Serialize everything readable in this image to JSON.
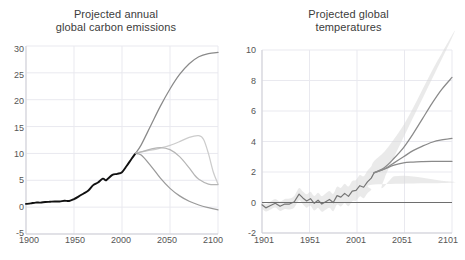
{
  "figure": {
    "width": 465,
    "height": 260,
    "background": "#ffffff",
    "text_color": "#3c3c3c",
    "grid_color": "#e9e9ef"
  },
  "panels": [
    {
      "id": "emissions",
      "title": "Projected annual\nglobal carbon emissions"
    },
    {
      "id": "temperatures",
      "title": "Projected global\ntemperatures"
    }
  ],
  "chart_data": [
    {
      "type": "line",
      "id": "emissions",
      "title": "Projected annual global carbon emissions",
      "xlabel": "",
      "ylabel": "",
      "xlim": [
        1900,
        2100
      ],
      "ylim": [
        -5,
        30
      ],
      "xticks": [
        1900,
        1950,
        2000,
        2050,
        2100
      ],
      "yticks": [
        -5,
        0,
        5,
        10,
        15,
        20,
        25,
        30
      ],
      "grid": true,
      "legend": "none",
      "series": [
        {
          "name": "historical",
          "color": "#111111",
          "width": 1.9,
          "x": [
            1900,
            1905,
            1910,
            1915,
            1920,
            1925,
            1930,
            1935,
            1940,
            1945,
            1950,
            1955,
            1960,
            1965,
            1970,
            1975,
            1980,
            1983,
            1985,
            1990,
            1995,
            2000,
            2005,
            2010,
            2014
          ],
          "values": [
            0.6,
            0.7,
            0.85,
            0.85,
            0.95,
            1.0,
            1.05,
            1.05,
            1.2,
            1.15,
            1.5,
            2.0,
            2.55,
            3.1,
            4.1,
            4.6,
            5.3,
            5.0,
            5.25,
            6.0,
            6.2,
            6.5,
            7.7,
            9.0,
            10.0
          ]
        },
        {
          "name": "rcp8.5-high",
          "color": "#8a8a8a",
          "width": 1.25,
          "x": [
            2014,
            2020,
            2030,
            2040,
            2050,
            2060,
            2070,
            2080,
            2090,
            2100
          ],
          "values": [
            10.0,
            11.6,
            15.2,
            18.8,
            22.0,
            24.7,
            26.7,
            28.0,
            28.6,
            28.8
          ]
        },
        {
          "name": "rcp6.0-mid-late-peak",
          "color": "#cccccc",
          "width": 1.25,
          "x": [
            2014,
            2020,
            2030,
            2040,
            2050,
            2060,
            2070,
            2080,
            2085,
            2090,
            2095,
            2100
          ],
          "values": [
            10.0,
            10.3,
            10.6,
            11.0,
            11.5,
            12.2,
            13.0,
            13.3,
            12.6,
            10.0,
            6.6,
            4.3
          ]
        },
        {
          "name": "rcp4.5-mid-early-peak",
          "color": "#b5b5b5",
          "width": 1.25,
          "x": [
            2014,
            2020,
            2030,
            2040,
            2050,
            2060,
            2070,
            2075,
            2080,
            2090,
            2100
          ],
          "values": [
            10.0,
            10.3,
            10.8,
            11.1,
            10.7,
            9.4,
            7.3,
            6.1,
            5.2,
            4.3,
            4.2
          ]
        },
        {
          "name": "rcp2.6-mitigation",
          "color": "#9a9a9a",
          "width": 1.25,
          "x": [
            2014,
            2020,
            2030,
            2040,
            2050,
            2060,
            2070,
            2080,
            2090,
            2100
          ],
          "values": [
            10.0,
            9.7,
            7.7,
            5.4,
            3.5,
            2.1,
            1.1,
            0.4,
            -0.1,
            -0.5
          ]
        }
      ]
    },
    {
      "type": "line",
      "id": "temperatures",
      "title": "Projected global temperatures",
      "xlabel": "",
      "ylabel": "",
      "xlim": [
        1901,
        2101
      ],
      "ylim": [
        -2,
        10
      ],
      "xticks": [
        1901,
        1951,
        2001,
        2051,
        2101
      ],
      "yticks": [
        -2,
        0,
        2,
        4,
        6,
        8,
        10
      ],
      "grid": true,
      "legend": "none",
      "uncertainty_band": {
        "color": "#d8d8d8",
        "description": "grey shaded spread around observed and projected temperature lines"
      },
      "series": [
        {
          "name": "observed",
          "color": "#767676",
          "width": 1.2,
          "x": [
            1901,
            1905,
            1910,
            1915,
            1920,
            1925,
            1930,
            1935,
            1940,
            1944,
            1948,
            1952,
            1956,
            1960,
            1964,
            1968,
            1972,
            1976,
            1980,
            1984,
            1988,
            1992,
            1996,
            2000,
            2004,
            2008,
            2012,
            2016,
            2019
          ],
          "values": [
            -0.15,
            -0.35,
            -0.2,
            -0.05,
            -0.25,
            -0.1,
            -0.1,
            0.05,
            0.55,
            0.3,
            0.1,
            0.25,
            -0.05,
            0.15,
            -0.1,
            0.05,
            0.2,
            0.0,
            0.45,
            0.35,
            0.6,
            0.4,
            0.75,
            0.8,
            1.1,
            1.0,
            1.35,
            1.6,
            1.95
          ]
        },
        {
          "name": "high-scenario",
          "color": "#8a8a8a",
          "width": 1.25,
          "x": [
            2019,
            2030,
            2040,
            2050,
            2060,
            2070,
            2080,
            2090,
            2101
          ],
          "values": [
            1.95,
            2.3,
            2.9,
            3.6,
            4.5,
            5.5,
            6.5,
            7.4,
            8.2
          ]
        },
        {
          "name": "mid-scenario",
          "color": "#8a8a8a",
          "width": 1.25,
          "x": [
            2019,
            2030,
            2040,
            2050,
            2060,
            2070,
            2080,
            2090,
            2101
          ],
          "values": [
            1.95,
            2.2,
            2.6,
            3.0,
            3.4,
            3.7,
            3.95,
            4.1,
            4.2
          ]
        },
        {
          "name": "low-scenario",
          "color": "#8a8a8a",
          "width": 1.25,
          "x": [
            2019,
            2030,
            2040,
            2050,
            2060,
            2070,
            2080,
            2090,
            2101
          ],
          "values": [
            1.95,
            2.2,
            2.45,
            2.6,
            2.65,
            2.68,
            2.7,
            2.7,
            2.7
          ]
        },
        {
          "name": "baseline-zero",
          "color": "#6e6e6e",
          "width": 1.2,
          "x": [
            1901,
            2101
          ],
          "values": [
            0,
            0
          ]
        }
      ]
    }
  ]
}
